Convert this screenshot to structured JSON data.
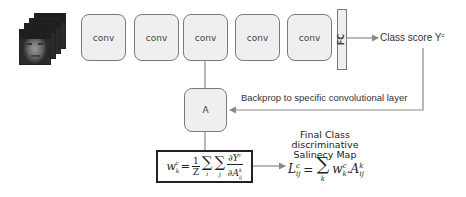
{
  "input": {
    "icon": "face-image-stack-icon",
    "frames": 4
  },
  "layers": [
    {
      "label": "conv"
    },
    {
      "label": "conv"
    },
    {
      "label": "conv"
    },
    {
      "label": "conv"
    },
    {
      "label": "conv"
    }
  ],
  "fc": {
    "label": "FC"
  },
  "output": {
    "label": "Class score Y",
    "superscript": "c"
  },
  "activation": {
    "label": "A"
  },
  "backprop": {
    "label": "Backprop to specific convolutional layer"
  },
  "weight_formula": {
    "lhs": "w",
    "lhs_sub": "k",
    "lhs_sup": "c",
    "frac_num": "1",
    "frac_den": "Z",
    "sum1_index": "i",
    "sum2_index": "j",
    "deriv_num": "∂Y",
    "deriv_num_sup": "c",
    "deriv_den": "∂A",
    "deriv_den_sup": "k",
    "deriv_den_sub": "ij"
  },
  "saliency": {
    "title_lines": [
      "Final Class",
      "discriminative",
      "Salinecy Map"
    ],
    "lhs": "L",
    "lhs_sup": "c",
    "lhs_sub": "ij",
    "sum_index": "k",
    "term_w": "w",
    "term_w_sub": "k",
    "term_w_sup": "c",
    "term_a": "A",
    "term_a_sup": "k",
    "term_a_sub": "ij"
  },
  "colors": {
    "box_fill": "#efefef",
    "box_border": "#7a7a7a",
    "line": "#8a8a8a",
    "text": "#333333"
  }
}
